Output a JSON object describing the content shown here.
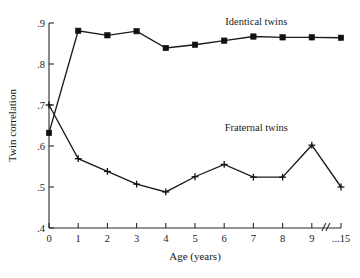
{
  "chart_data": {
    "type": "line",
    "title": "",
    "xlabel": "Age (years)",
    "ylabel": "Twin correlation",
    "x": [
      0,
      1,
      2,
      3,
      4,
      5,
      6,
      7,
      8,
      9,
      15
    ],
    "xtick_labels": [
      "0",
      "1",
      "2",
      "3",
      "4",
      "5",
      "6",
      "7",
      "8",
      "9",
      "...15"
    ],
    "ytick_labels": [
      ".4",
      ".5",
      ".6",
      ".7",
      ".8",
      ".9"
    ],
    "ytick_values": [
      0.4,
      0.5,
      0.6,
      0.7,
      0.8,
      0.9
    ],
    "ylim": [
      0.4,
      0.9
    ],
    "xlim": [
      0,
      10
    ],
    "axis_break": {
      "present": true,
      "between": [
        "9",
        "...15"
      ],
      "symbol": "//"
    },
    "grid": false,
    "legend_position": "inline-annotations",
    "series": [
      {
        "name": "Identical twins",
        "marker": "filled-square",
        "values": [
          0.632,
          0.881,
          0.87,
          0.88,
          0.839,
          0.847,
          0.857,
          0.867,
          0.865,
          0.865,
          0.864
        ]
      },
      {
        "name": "Fraternal twins",
        "marker": "plus",
        "values": [
          0.7,
          0.569,
          0.538,
          0.507,
          0.488,
          0.525,
          0.555,
          0.524,
          0.524,
          0.602,
          0.5
        ]
      }
    ],
    "annotations": [
      {
        "text": "Identical twins",
        "x": 7.1,
        "y": 0.895
      },
      {
        "text": "Fraternal twins",
        "x": 7.1,
        "y": 0.637
      }
    ]
  }
}
